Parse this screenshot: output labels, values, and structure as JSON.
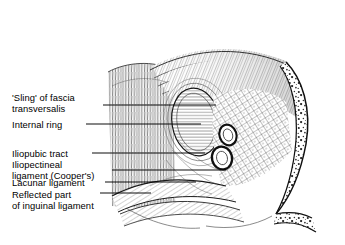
{
  "figure": {
    "kind": "anatomical-line-drawing",
    "style": "black-and-white pen-and-ink hatching",
    "background_color": "#ffffff",
    "ink_color": "#1a1a1a",
    "width": 345,
    "height": 245
  },
  "labels": [
    {
      "id": "sling-of-fascia-transversalis",
      "lines": [
        "'Sling' of fascia",
        "transversalis"
      ],
      "text_x": 12,
      "text_y": 92,
      "leader": {
        "x1": 103,
        "y1": 105,
        "x2": 216,
        "y2": 105
      }
    },
    {
      "id": "internal-ring",
      "lines": [
        "Internal ring"
      ],
      "text_x": 12,
      "text_y": 119,
      "leader": {
        "x1": 86,
        "y1": 124,
        "x2": 201,
        "y2": 124
      }
    },
    {
      "id": "iliopubic-tract",
      "lines": [
        "Iliopubic tract"
      ],
      "text_x": 12,
      "text_y": 148,
      "leader": {
        "x1": 92,
        "y1": 153,
        "x2": 205,
        "y2": 153
      }
    },
    {
      "id": "iliopectineal-ligament-coopers",
      "lines": [
        "Iliopectineal",
        "ligament (Cooper's)"
      ],
      "text_x": 12,
      "text_y": 159,
      "leader": {
        "x1": 112,
        "y1": 170,
        "x2": 226,
        "y2": 170
      }
    },
    {
      "id": "lacunar-ligament",
      "lines": [
        "Lacunar ligament"
      ],
      "text_x": 12,
      "text_y": 177,
      "leader": {
        "x1": 105,
        "y1": 182,
        "x2": 196,
        "y2": 182
      }
    },
    {
      "id": "reflected-part-of-inguinal-ligament",
      "lines": [
        "Reflected part",
        "of inguinal ligament"
      ],
      "text_x": 12,
      "text_y": 189,
      "leader": {
        "x1": 100,
        "y1": 193,
        "x2": 151,
        "y2": 193
      }
    }
  ],
  "structures": [
    {
      "id": "rectus-abdominis",
      "texture": "vertical-fiber-hatching",
      "region": "left-upper"
    },
    {
      "id": "transversus-abdominis-arch",
      "texture": "sweeping-curved-fibers",
      "region": "top-right"
    },
    {
      "id": "internal-inguinal-ring",
      "texture": "concentric-oval-horizontal-hatch",
      "region": "center"
    },
    {
      "id": "femoral-vessels",
      "texture": "oval-cross-sections",
      "region": "center-right",
      "count": 2
    },
    {
      "id": "pectineus-iliopsoas",
      "texture": "cross-hatched-muscle",
      "region": "right-middle"
    },
    {
      "id": "pubic-bone",
      "texture": "stippled-cancellous-bone",
      "region": "right-edge"
    },
    {
      "id": "lacunar-and-reflected-ligaments",
      "texture": "curved-fiber-bands",
      "region": "bottom"
    }
  ]
}
